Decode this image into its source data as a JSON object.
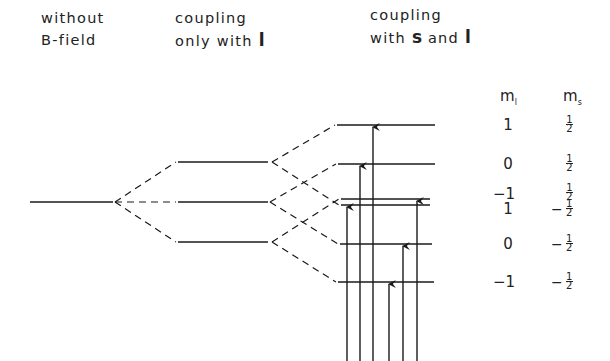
{
  "headers": {
    "col1": {
      "line1": "without",
      "line2": "B-field"
    },
    "col2": {
      "line1": "coupling",
      "line2_prefix": "only with ",
      "line2_bold": "l"
    },
    "col3": {
      "line1": "coupling",
      "line2_prefix": "with ",
      "line2_bold1": "s",
      "line2_mid": " and ",
      "line2_bold2": "l"
    }
  },
  "quantum_labels": {
    "ml_header": "m",
    "ml_sub": "l",
    "ms_header": "m",
    "ms_sub": "s"
  },
  "levels": [
    {
      "ml": "1",
      "ms_sign": "",
      "ms_num": "1",
      "ms_den": "2",
      "y": 125
    },
    {
      "ml": "0",
      "ms_sign": "",
      "ms_num": "1",
      "ms_den": "2",
      "y": 164
    },
    {
      "ml": "−1",
      "ms_sign": "",
      "ms_num": "1",
      "ms_den": "2",
      "y": 199
    },
    {
      "ml": "1",
      "ms_sign": "−",
      "ms_num": "1",
      "ms_den": "2",
      "y": 204
    },
    {
      "ml": "0",
      "ms_sign": "−",
      "ms_num": "1",
      "ms_den": "2",
      "y": 244
    },
    {
      "ml": "−1",
      "ms_sign": "−",
      "ms_num": "1",
      "ms_den": "2",
      "y": 282
    }
  ],
  "colors": {
    "line": "#1a1a1a",
    "text": "#222222",
    "background": "#ffffff"
  }
}
